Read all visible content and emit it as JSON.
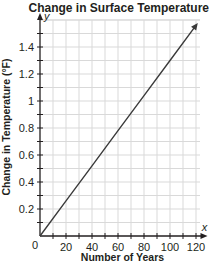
{
  "chart_data": {
    "type": "line",
    "title": "Change in Surface Temperature",
    "xlabel": "Number of Years",
    "ylabel": "Change in Temperature (°F)",
    "x_axis_var": "x",
    "y_axis_var": "y",
    "origin_label": "0",
    "xlim": [
      0,
      125
    ],
    "ylim": [
      0,
      1.6
    ],
    "x_ticks": [
      20,
      40,
      60,
      80,
      100,
      120
    ],
    "x_tick_labels": [
      "20",
      "40",
      "60",
      "80",
      "100",
      "120"
    ],
    "x_minor_step": 10,
    "y_ticks": [
      0.2,
      0.4,
      0.6,
      0.8,
      1,
      1.2,
      1.4
    ],
    "y_tick_labels": [
      "0.2",
      "0.4",
      "0.6",
      "0.8",
      "1",
      "1.2",
      "1.4"
    ],
    "y_minor_step": 0.1,
    "grid": true,
    "legend": null,
    "series": [
      {
        "name": "Change in Surface Temperature",
        "x": [
          0,
          20,
          40,
          60,
          80,
          100,
          120
        ],
        "values": [
          0,
          0.26,
          0.52,
          0.78,
          1.04,
          1.3,
          1.56
        ],
        "arrow_end": true,
        "color": "#3a3a3a"
      }
    ]
  },
  "colors": {
    "grid": "#d9d9d9",
    "axis": "#231f20",
    "line": "#3a3a3a"
  }
}
